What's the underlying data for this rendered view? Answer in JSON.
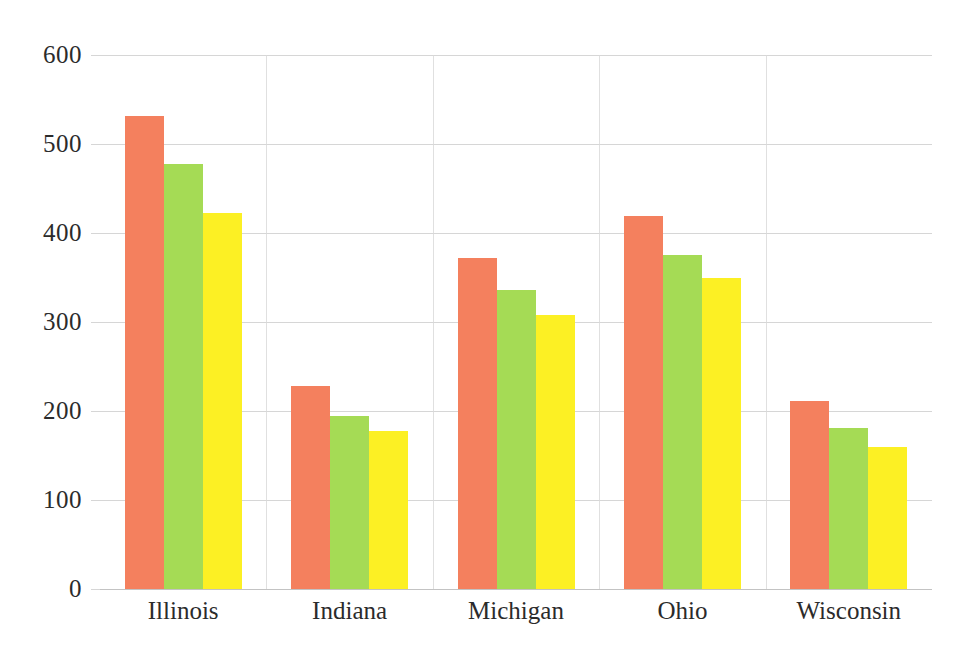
{
  "chart_data": {
    "type": "bar",
    "title": "",
    "subtitle": "",
    "xlabel": "",
    "ylabel": "",
    "categories": [
      "Illinois",
      "Indiana",
      "Michigan",
      "Ohio",
      "Wisconsin"
    ],
    "series": [
      {
        "name": "series-1",
        "color": "#f4805e",
        "values": [
          531,
          228,
          372,
          419,
          211
        ]
      },
      {
        "name": "series-2",
        "color": "#a5db55",
        "values": [
          477,
          194,
          336,
          375,
          181
        ]
      },
      {
        "name": "series-3",
        "color": "#fcf024",
        "values": [
          423,
          177,
          308,
          349,
          160
        ]
      }
    ],
    "ylim": [
      0,
      600
    ],
    "yticks": [
      0,
      100,
      200,
      300,
      400,
      500,
      600
    ],
    "ytick_labels": [
      "0",
      "100",
      "200",
      "300",
      "400",
      "500",
      "600"
    ],
    "xtick_labels": [
      "Illinois",
      "Indiana",
      "Michigan",
      "Ohio",
      "Wisconsin"
    ],
    "grid": {
      "horizontal": true,
      "vertical": true,
      "color": "#cfcfcf"
    },
    "legend": {
      "visible": false,
      "position": "none"
    },
    "annotations": []
  }
}
